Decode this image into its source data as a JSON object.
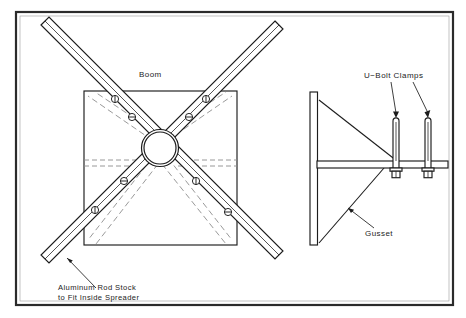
{
  "drawing": {
    "title": "Spreader and Boom Mount Assembly Detail",
    "canvas": {
      "width": 466,
      "height": 318
    },
    "background_color": "#ffffff",
    "line_color": "#1c1c1c",
    "hidden_line_color": "#8d8d8d",
    "border_color": "#2b2b2b"
  },
  "annotations": {
    "boom": {
      "label": "Boom",
      "x": 139,
      "y": 77
    },
    "rod_stock": {
      "line1": "Aluminum Rod Stock",
      "line2": "to Fit Inside Spreader",
      "x": 58,
      "y_line1": 288,
      "y_line2": 298
    },
    "u_bolt_clamps": {
      "label": "U−Bolt Clamps",
      "x": 364,
      "y": 78
    },
    "gusset": {
      "label": "Gusset",
      "x": 365,
      "y": 235
    }
  },
  "left_view": {
    "name": "spreader-plan-view",
    "boom_square": {
      "x": 84,
      "y": 91,
      "width": 153,
      "height": 154
    },
    "hub": {
      "center_x": 160,
      "center_y": 148,
      "outer_radius": 18.5,
      "inner_radius": 16
    },
    "arm_count": 4,
    "arm_width": 11,
    "marker_count": 8,
    "marker_radius": 3.6
  },
  "right_view": {
    "name": "mast-bracket-elevation",
    "mast": {
      "x": 310,
      "y": 92,
      "width": 7.5,
      "height": 153
    },
    "arm": {
      "x": 317,
      "y": 161,
      "width": 131,
      "height": 7
    },
    "gusset_upper": {
      "from_x": 319,
      "from_y": 100,
      "to_x": 395,
      "to_y": 161
    },
    "gusset_lower": {
      "from_x": 319,
      "from_y": 243,
      "to_x": 382,
      "to_y": 168
    },
    "u_bolts": [
      {
        "name": "u-bolt-left",
        "x": 396,
        "top_y": 118,
        "bottom_y": 168
      },
      {
        "name": "u-bolt-right",
        "x": 428,
        "top_y": 118,
        "bottom_y": 168
      }
    ],
    "u_bolt_rod_width": 6,
    "nut_width": 11,
    "nut_height": 9
  }
}
